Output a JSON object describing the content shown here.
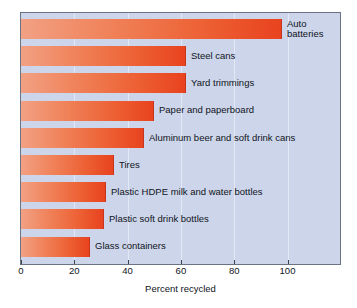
{
  "chart_data": {
    "type": "bar",
    "orientation": "horizontal",
    "title": "",
    "xlabel": "Percent recycled",
    "ylabel": "",
    "xlim": [
      0,
      120
    ],
    "grid": true,
    "legend": "none",
    "xticks": [
      0,
      20,
      40,
      60,
      80,
      100
    ],
    "categories": [
      "Auto\nbatteries",
      "Steel cans",
      "Yard trimmings",
      "Paper and paperboard",
      "Aluminum beer and soft drink cans",
      "Tires",
      "Plastic HDPE milk and water bottles",
      "Plastic soft drink bottles",
      "Glass containers"
    ],
    "values": [
      98,
      62,
      62,
      50,
      46,
      35,
      32,
      31,
      26
    ],
    "bars": [
      {
        "label": "Auto\nbatteries",
        "value": 98,
        "two_line": true
      },
      {
        "label": "Steel cans",
        "value": 62,
        "two_line": false
      },
      {
        "label": "Yard trimmings",
        "value": 62,
        "two_line": false
      },
      {
        "label": "Paper and paperboard",
        "value": 50,
        "two_line": false
      },
      {
        "label": "Aluminum beer and soft drink cans",
        "value": 46,
        "two_line": false
      },
      {
        "label": "Tires",
        "value": 35,
        "two_line": false
      },
      {
        "label": "Plastic HDPE milk and water bottles",
        "value": 32,
        "two_line": false
      },
      {
        "label": "Plastic soft drink bottles",
        "value": 31,
        "two_line": false
      },
      {
        "label": "Glass containers",
        "value": 26,
        "two_line": false
      }
    ],
    "colors": {
      "bar_gradient_start": "#f2a184",
      "bar_gradient_end": "#e8431f",
      "plot_background": "#ccd5e9",
      "gridline": "#e3e9f4",
      "frame": "#6a7383",
      "text": "#10141c"
    }
  }
}
